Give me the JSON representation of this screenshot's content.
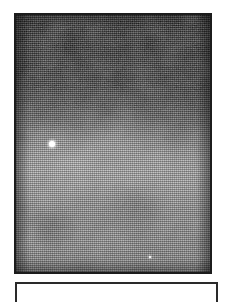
{
  "page": {
    "background_color": "#ffffff",
    "width": 226,
    "height": 295,
    "caption": ""
  },
  "plate_figure": {
    "label": "astronomical plate photograph",
    "alt_text": "Halftone-printed grayscale photographic plate of a dense star field / Milky Way nebulosity",
    "frame_color": "#1c1c1c",
    "frame_width_px": 2,
    "x": 14,
    "y": 13,
    "width": 198,
    "height": 261,
    "rendering": "halftone dot screen",
    "luminance_profile": {
      "top_band": "#131313",
      "mid_transition": "#575757",
      "bright_band": "#a2a2a2",
      "lower_band": "#838383"
    },
    "stars": [
      {
        "name": "bright-star-primary",
        "x_pct": 18.5,
        "y_pct": 50.0,
        "size": "primary",
        "color": "#ffffff"
      },
      {
        "name": "faint-star-secondary",
        "x_pct": 69.0,
        "y_pct": 94.0,
        "size": "secondary",
        "color": "#ffffff"
      }
    ]
  },
  "lower_panel": {
    "label": "lower framed panel",
    "content": "",
    "frame_color": "#2a2a2a",
    "frame_width_px": 2,
    "background_color": "#ffffff",
    "x": 15,
    "y": 282,
    "width": 203,
    "height": 20
  }
}
